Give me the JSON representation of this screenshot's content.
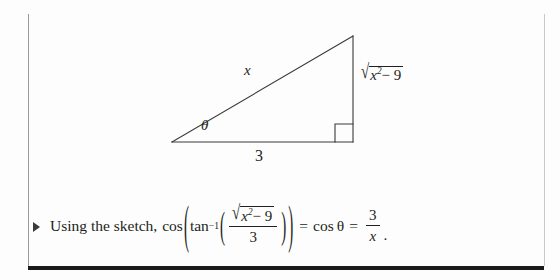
{
  "slide": {
    "background_color": "#fdfdfd",
    "ink_color": "#231f20",
    "rule_color": "#9a9a9a",
    "bottom_rule_color": "#1a1a1a"
  },
  "figure": {
    "type": "right-triangle-sketch",
    "vertices": {
      "left": [
        172,
        142
      ],
      "bottom_right": [
        353,
        142
      ],
      "top": [
        353,
        36
      ]
    },
    "right_angle_marker_size": 18,
    "labels": {
      "hypotenuse": "x",
      "angle": "θ",
      "base": "3",
      "opposite_radical_sign": "√",
      "opposite_radicand_base": "x",
      "opposite_radicand_exponent": "2",
      "opposite_radicand_rest": "− 9"
    }
  },
  "bullet": {
    "marker": "triangle-right-bullet",
    "lead_text": "Using the sketch,",
    "equation": {
      "cos_outer": "cos",
      "open_paren_outer": "(",
      "arctan": "tan",
      "arctan_exponent": "−1",
      "open_paren_inner": "(",
      "numerator_radical_sign": "√",
      "numerator_base": "x",
      "numerator_exponent": "2",
      "numerator_rest": "− 9",
      "denominator": "3",
      "close_paren_inner": ")",
      "close_paren_outer": ")",
      "equals_1": "=",
      "cos_theta": "cos θ",
      "equals_2": "=",
      "result_numerator": "3",
      "result_denominator": "x",
      "terminator": "."
    },
    "plain_text": "Using the sketch, cos(tan⁻¹(√(x² − 9)/3)) = cos θ = 3/x."
  }
}
